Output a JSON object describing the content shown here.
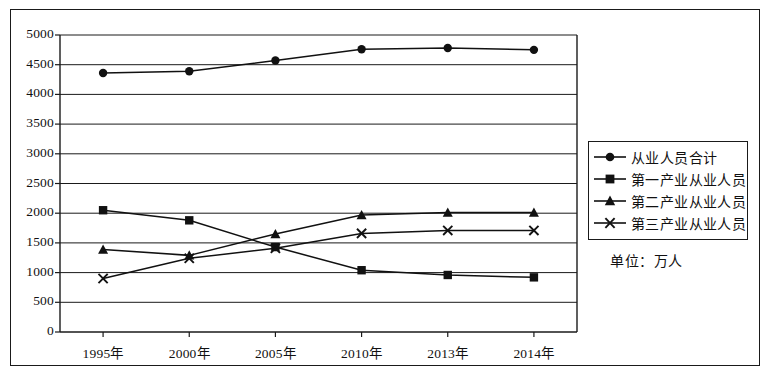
{
  "chart_data": {
    "type": "line",
    "title": "",
    "subtitle": "",
    "xlabel": "",
    "ylabel": "",
    "unit_note": "单位：万人",
    "categories": [
      "1995年",
      "2000年",
      "2005年",
      "2010年",
      "2013年",
      "2014年"
    ],
    "ylim": [
      0,
      5000
    ],
    "ytick_step": 500,
    "ytick_labels": [
      "5000",
      "4500",
      "4000",
      "3500",
      "3000",
      "2500",
      "2000",
      "1500",
      "1000",
      "500",
      "0"
    ],
    "grid": true,
    "grid_axis": "y",
    "legend_position": "right",
    "series": [
      {
        "name": "从业人员合计",
        "marker": "circle",
        "values": [
          4360,
          4390,
          4570,
          4760,
          4780,
          4750
        ]
      },
      {
        "name": "第一产业从业人员",
        "marker": "square",
        "values": [
          2050,
          1880,
          1430,
          1040,
          960,
          920
        ]
      },
      {
        "name": "第二产业从业人员",
        "marker": "triangle",
        "values": [
          1390,
          1290,
          1650,
          1970,
          2010,
          2010
        ]
      },
      {
        "name": "第三产业从业人员",
        "marker": "x",
        "values": [
          900,
          1240,
          1410,
          1660,
          1710,
          1710
        ]
      }
    ]
  },
  "colors": {
    "line": "#111111",
    "axis": "#1a1a1a",
    "grid": "#1a1a1a",
    "background": "#ffffff"
  },
  "legend": {
    "items": [
      {
        "label": "从业人员合计",
        "marker": "circle-marker-icon"
      },
      {
        "label": "第一产业从业人员",
        "marker": "square-marker-icon"
      },
      {
        "label": "第二产业从业人员",
        "marker": "triangle-marker-icon"
      },
      {
        "label": "第三产业从业人员",
        "marker": "x-marker-icon"
      }
    ]
  }
}
